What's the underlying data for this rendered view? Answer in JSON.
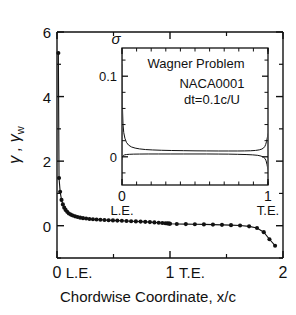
{
  "chart_data": {
    "type": "scatter",
    "title": "",
    "xlabel": "Chordwise Coordinate, x/c",
    "ylabel": "γ , γ",
    "ylabel_sub": "w",
    "xlim": [
      0,
      2
    ],
    "ylim": [
      -1,
      6
    ],
    "grid": false,
    "legend": null,
    "xticks": [
      {
        "value": 0,
        "label": "0",
        "secondary": "L.E."
      },
      {
        "value": 1,
        "label": "1",
        "secondary": "T.E."
      },
      {
        "value": 2,
        "label": "2",
        "secondary": ""
      }
    ],
    "yticks": [
      {
        "value": 0,
        "label": "0"
      },
      {
        "value": 2,
        "label": "2"
      },
      {
        "value": 4,
        "label": "4"
      },
      {
        "value": 6,
        "label": "6"
      }
    ],
    "series": [
      {
        "name": "bound vorticity and wake vorticity",
        "marker": "filled-circle",
        "line": true,
        "x": [
          0.012,
          0.018,
          0.028,
          0.04,
          0.052,
          0.064,
          0.076,
          0.09,
          0.105,
          0.122,
          0.14,
          0.16,
          0.182,
          0.205,
          0.23,
          0.258,
          0.287,
          0.318,
          0.35,
          0.384,
          0.42,
          0.457,
          0.495,
          0.534,
          0.574,
          0.615,
          0.656,
          0.698,
          0.74,
          0.781,
          0.822,
          0.862,
          0.9,
          0.932,
          0.958,
          0.976,
          0.988,
          0.996,
          1.0,
          1.06,
          1.14,
          1.22,
          1.3,
          1.38,
          1.46,
          1.54,
          1.62,
          1.7,
          1.77,
          1.83,
          1.88,
          1.93
        ],
        "y": [
          5.35,
          1.48,
          1.05,
          0.8,
          0.66,
          0.56,
          0.49,
          0.43,
          0.38,
          0.345,
          0.315,
          0.29,
          0.268,
          0.25,
          0.235,
          0.222,
          0.21,
          0.2,
          0.192,
          0.184,
          0.177,
          0.17,
          0.164,
          0.158,
          0.152,
          0.146,
          0.14,
          0.134,
          0.127,
          0.12,
          0.112,
          0.103,
          0.094,
          0.085,
          0.078,
          0.072,
          0.068,
          0.065,
          0.062,
          0.055,
          0.05,
          0.045,
          0.04,
          0.034,
          0.027,
          0.018,
          0.005,
          -0.02,
          -0.07,
          -0.2,
          -0.42,
          -0.62
        ]
      }
    ],
    "inset": {
      "type": "line",
      "ylabel": "σ",
      "xlim": [
        0,
        1
      ],
      "ylim": [
        -0.035,
        0.135
      ],
      "yticks": [
        {
          "value": 0,
          "label": "0"
        },
        {
          "value": 0.1,
          "label": "0.1"
        }
      ],
      "xticks": [
        {
          "value": 0,
          "label": "0",
          "secondary": "L.E."
        },
        {
          "value": 1,
          "label": "1",
          "secondary": "T.E."
        }
      ],
      "annotations": [
        {
          "id": "inset-title",
          "text": "Wagner Problem"
        },
        {
          "id": "inset-airfoil",
          "text": "NACA0001"
        },
        {
          "id": "inset-timestep",
          "text": "dt=0.1c/U"
        }
      ],
      "series": [
        {
          "name": "source-strength-upper",
          "x": [
            0.0,
            0.003,
            0.007,
            0.012,
            0.02,
            0.03,
            0.045,
            0.065,
            0.09,
            0.12,
            0.16,
            0.21,
            0.27,
            0.34,
            0.42,
            0.5,
            0.58,
            0.66,
            0.73,
            0.79,
            0.84,
            0.88,
            0.915,
            0.94,
            0.958,
            0.97,
            0.978,
            0.984,
            0.99,
            0.995,
            1.0
          ],
          "y": [
            0.115,
            0.062,
            0.04,
            0.03,
            0.023,
            0.018,
            0.0145,
            0.0122,
            0.0108,
            0.0098,
            0.009,
            0.0085,
            0.0081,
            0.0078,
            0.0076,
            0.0074,
            0.0073,
            0.0072,
            0.0072,
            0.0072,
            0.0073,
            0.0075,
            0.0079,
            0.0086,
            0.0096,
            0.011,
            0.0128,
            0.0152,
            0.019,
            0.0235,
            0.029
          ]
        },
        {
          "name": "source-strength-lower",
          "x": [
            0.0,
            0.004,
            0.01,
            0.018,
            0.03,
            0.05,
            0.08,
            0.12,
            0.18,
            0.25,
            0.33,
            0.42,
            0.5,
            0.58,
            0.66,
            0.73,
            0.79,
            0.85,
            0.895,
            0.93,
            0.952,
            0.968,
            0.979,
            0.987,
            0.993,
            1.0
          ],
          "y": [
            -0.004,
            0.0005,
            0.0018,
            0.0024,
            0.0028,
            0.0031,
            0.0033,
            0.0034,
            0.0035,
            0.0035,
            0.0035,
            0.0035,
            0.0035,
            0.0035,
            0.0034,
            0.0033,
            0.0031,
            0.0028,
            0.0024,
            0.0018,
            0.0009,
            -0.0003,
            -0.002,
            -0.005,
            -0.0095,
            -0.016
          ]
        },
        {
          "name": "leading-edge-spike",
          "x": [
            0.0,
            0.0
          ],
          "y": [
            -0.033,
            0.135
          ]
        }
      ]
    }
  }
}
